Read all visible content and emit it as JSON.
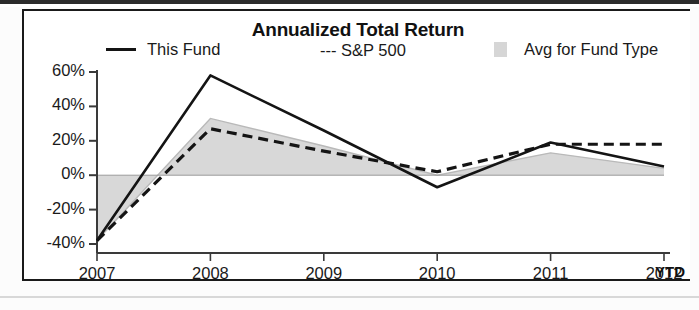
{
  "chart_data": {
    "type": "line",
    "title": "Annualized Total Return",
    "xlabel": "",
    "ylabel": "",
    "categories": [
      "2007",
      "2008",
      "2009",
      "2010",
      "2011",
      "2012"
    ],
    "x_axis_note": "YTD",
    "ytick_labels": [
      "60%",
      "40%",
      "20%",
      "0%",
      "-20%",
      "-40%"
    ],
    "ytick_values": [
      60,
      40,
      20,
      0,
      -20,
      -40
    ],
    "ylim": [
      -40,
      60
    ],
    "grid": false,
    "legend_position": "top",
    "series": [
      {
        "name": "This Fund",
        "style": "solid",
        "color": "#141414",
        "values": [
          -38,
          58,
          26,
          -7,
          19,
          5
        ]
      },
      {
        "name": "S&P 500",
        "style": "dashed",
        "color": "#141414",
        "values": [
          -38,
          27,
          14,
          2,
          18,
          18
        ]
      },
      {
        "name": "Avg for Fund Type",
        "style": "area",
        "color": "#d6d6d6",
        "values": [
          -38,
          33,
          17,
          0,
          13,
          4
        ]
      }
    ]
  },
  "chart": {
    "title": "Annualized Total Return",
    "legend": {
      "this_fund": "This Fund",
      "sp500": "--- S&P 500",
      "avg_fund_type": "Avg for Fund Type"
    },
    "ytd_label": "YTD"
  },
  "colors": {
    "line": "#141414",
    "area_fill": "#d6d6d6",
    "axis": "#3a3a3a",
    "border": "#1a1a1a",
    "background": "#ffffff"
  }
}
